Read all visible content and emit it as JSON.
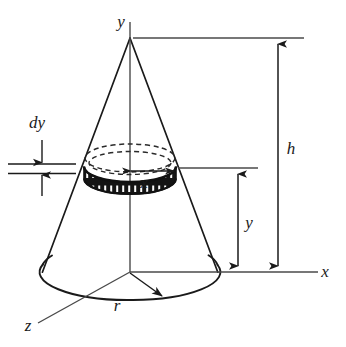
{
  "figure": {
    "type": "geometry-diagram",
    "background_color": "#ffffff",
    "stroke_color": "#1a1a1a",
    "band_fill_color": "#111111"
  },
  "axes": {
    "vertical_label": "y",
    "horizontal_label": "x",
    "depth_label": "z"
  },
  "dimensions": {
    "height_label": "h",
    "radius_label": "r",
    "disk_height_label": "y",
    "disk_radius_label": "x",
    "thickness_label": "dy"
  },
  "geometry": {
    "apex": {
      "x": 130,
      "y": 38
    },
    "base_center": {
      "x": 130,
      "y": 272
    },
    "base_rx": 88,
    "base_ry": 28,
    "disk_center_y": 168,
    "disk_rx": 45,
    "disk_ry": 14,
    "disk_band_thickness": 12,
    "h_dim_x": 278,
    "y_dim_x": 238,
    "dy_tick_top_y": 163,
    "dy_tick_bottom_y": 173
  },
  "labels": {
    "y_axis": {
      "text": "y",
      "x": 121,
      "y": 27
    },
    "x_axis": {
      "text": "x",
      "x": 325,
      "y": 277
    },
    "z_axis": {
      "text": "z",
      "x": 28,
      "y": 331
    },
    "h": {
      "text": "h",
      "x": 291,
      "y": 154
    },
    "y_dim": {
      "text": "y",
      "x": 249,
      "y": 228
    },
    "x_radius": {
      "text": "x",
      "x": 144,
      "y": 188
    },
    "r": {
      "text": "r",
      "x": 117,
      "y": 311
    },
    "dy": {
      "text": "dy",
      "x": 29,
      "y": 128
    }
  }
}
